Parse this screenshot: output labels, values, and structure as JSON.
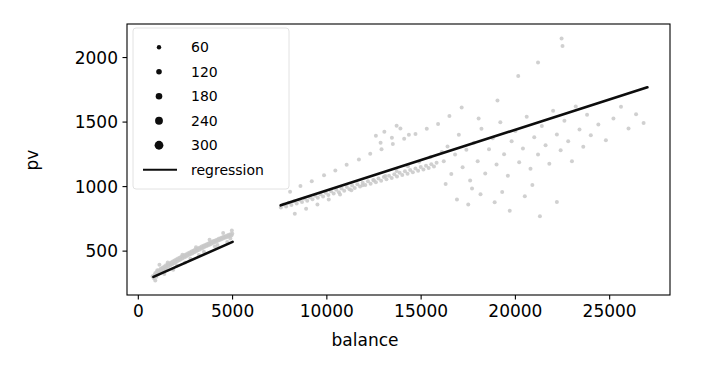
{
  "chart_data": {
    "type": "scatter",
    "title": "",
    "xlabel": "balance",
    "ylabel": "pv",
    "xlim": [
      -600,
      28200
    ],
    "ylim": [
      160,
      2260
    ],
    "xticks": [
      0,
      5000,
      10000,
      15000,
      20000,
      25000
    ],
    "xticklabels": [
      "0",
      "5000",
      "10000",
      "15000",
      "20000",
      "25000"
    ],
    "yticks": [
      500,
      1000,
      1500,
      2000
    ],
    "yticklabels": [
      "500",
      "1000",
      "1500",
      "2000"
    ],
    "grid": false,
    "marker_color": "#c8c8c8",
    "line_color": "#0d0d0d",
    "legend": {
      "position": "upper left",
      "size_title": "",
      "size_entries": [
        {
          "label": "60",
          "value": 60,
          "radius": 2.2
        },
        {
          "label": "120",
          "value": 120,
          "radius": 2.8
        },
        {
          "label": "180",
          "value": 180,
          "radius": 3.3
        },
        {
          "label": "240",
          "value": 240,
          "radius": 3.9
        },
        {
          "label": "300",
          "value": 300,
          "radius": 4.4
        }
      ],
      "line_entries": [
        {
          "label": "regression"
        }
      ]
    },
    "series": [
      {
        "name": "segment-low",
        "regression_line": {
          "x": [
            800,
            5000
          ],
          "y": [
            300,
            572
          ]
        },
        "points": [
          [
            760,
            306
          ],
          [
            812,
            292
          ],
          [
            880,
            318
          ],
          [
            905,
            330
          ],
          [
            960,
            301
          ],
          [
            1010,
            345
          ],
          [
            1060,
            322
          ],
          [
            1105,
            352
          ],
          [
            1150,
            338
          ],
          [
            1190,
            364
          ],
          [
            1240,
            349
          ],
          [
            1285,
            372
          ],
          [
            1330,
            358
          ],
          [
            1380,
            381
          ],
          [
            1420,
            366
          ],
          [
            1470,
            390
          ],
          [
            1510,
            374
          ],
          [
            1560,
            398
          ],
          [
            1600,
            383
          ],
          [
            1650,
            405
          ],
          [
            1695,
            391
          ],
          [
            1740,
            412
          ],
          [
            1790,
            399
          ],
          [
            1830,
            420
          ],
          [
            1880,
            407
          ],
          [
            1925,
            428
          ],
          [
            1970,
            414
          ],
          [
            2015,
            435
          ],
          [
            2060,
            422
          ],
          [
            2105,
            442
          ],
          [
            2150,
            429
          ],
          [
            2195,
            449
          ],
          [
            2240,
            436
          ],
          [
            2285,
            456
          ],
          [
            2330,
            443
          ],
          [
            2375,
            462
          ],
          [
            2420,
            450
          ],
          [
            2465,
            470
          ],
          [
            2510,
            457
          ],
          [
            2555,
            476
          ],
          [
            2600,
            464
          ],
          [
            2645,
            483
          ],
          [
            2690,
            471
          ],
          [
            2735,
            490
          ],
          [
            2780,
            478
          ],
          [
            2825,
            497
          ],
          [
            2870,
            484
          ],
          [
            2915,
            503
          ],
          [
            2960,
            491
          ],
          [
            3005,
            510
          ],
          [
            3050,
            498
          ],
          [
            3095,
            516
          ],
          [
            3140,
            505
          ],
          [
            3185,
            523
          ],
          [
            3230,
            511
          ],
          [
            3275,
            529
          ],
          [
            3320,
            518
          ],
          [
            3365,
            536
          ],
          [
            3410,
            524
          ],
          [
            3455,
            542
          ],
          [
            3500,
            531
          ],
          [
            3545,
            548
          ],
          [
            3590,
            537
          ],
          [
            3635,
            554
          ],
          [
            3680,
            544
          ],
          [
            3725,
            560
          ],
          [
            3770,
            550
          ],
          [
            3815,
            566
          ],
          [
            3860,
            556
          ],
          [
            3905,
            572
          ],
          [
            3950,
            562
          ],
          [
            3995,
            578
          ],
          [
            4040,
            568
          ],
          [
            4085,
            583
          ],
          [
            4130,
            574
          ],
          [
            4175,
            589
          ],
          [
            4220,
            580
          ],
          [
            4265,
            595
          ],
          [
            4310,
            586
          ],
          [
            4355,
            600
          ],
          [
            4400,
            592
          ],
          [
            4445,
            606
          ],
          [
            4490,
            597
          ],
          [
            4535,
            611
          ],
          [
            4580,
            603
          ],
          [
            4625,
            616
          ],
          [
            4670,
            608
          ],
          [
            4715,
            621
          ],
          [
            4760,
            613
          ],
          [
            4805,
            626
          ],
          [
            4850,
            618
          ],
          [
            4895,
            630
          ],
          [
            4940,
            622
          ],
          [
            4985,
            634
          ],
          [
            1120,
            395
          ],
          [
            1850,
            355
          ],
          [
            2480,
            412
          ],
          [
            3210,
            470
          ],
          [
            4060,
            535
          ],
          [
            4720,
            570
          ],
          [
            900,
            272
          ],
          [
            1380,
            322
          ],
          [
            2050,
            388
          ],
          [
            2760,
            440
          ],
          [
            3480,
            495
          ],
          [
            4200,
            548
          ],
          [
            4880,
            598
          ],
          [
            1560,
            412
          ],
          [
            2340,
            472
          ],
          [
            3060,
            530
          ],
          [
            3780,
            588
          ],
          [
            4500,
            640
          ],
          [
            1010,
            352
          ],
          [
            4960,
            660
          ]
        ]
      },
      {
        "name": "segment-high",
        "regression_line": {
          "x": [
            7550,
            27000
          ],
          "y": [
            855,
            1770
          ]
        },
        "points": [
          [
            7560,
            838
          ],
          [
            7700,
            862
          ],
          [
            7840,
            845
          ],
          [
            7980,
            874
          ],
          [
            8120,
            858
          ],
          [
            8260,
            886
          ],
          [
            8400,
            869
          ],
          [
            8540,
            896
          ],
          [
            8680,
            880
          ],
          [
            8820,
            908
          ],
          [
            8960,
            891
          ],
          [
            9100,
            918
          ],
          [
            9240,
            902
          ],
          [
            9380,
            930
          ],
          [
            9520,
            913
          ],
          [
            9660,
            941
          ],
          [
            9800,
            924
          ],
          [
            9940,
            952
          ],
          [
            10080,
            935
          ],
          [
            10220,
            963
          ],
          [
            10360,
            946
          ],
          [
            10500,
            975
          ],
          [
            10640,
            957
          ],
          [
            10780,
            986
          ],
          [
            10920,
            968
          ],
          [
            11060,
            997
          ],
          [
            11200,
            979
          ],
          [
            11340,
            1008
          ],
          [
            11480,
            990
          ],
          [
            11620,
            1019
          ],
          [
            11760,
            1001
          ],
          [
            11900,
            1030
          ],
          [
            12040,
            1012
          ],
          [
            12180,
            1041
          ],
          [
            12320,
            1023
          ],
          [
            12460,
            1052
          ],
          [
            12600,
            1034
          ],
          [
            12740,
            1063
          ],
          [
            12880,
            1045
          ],
          [
            13020,
            1074
          ],
          [
            13160,
            1056
          ],
          [
            13300,
            1085
          ],
          [
            13440,
            1067
          ],
          [
            13580,
            1096
          ],
          [
            13720,
            1078
          ],
          [
            13860,
            1107
          ],
          [
            14000,
            1089
          ],
          [
            14140,
            1118
          ],
          [
            14280,
            1100
          ],
          [
            14420,
            1129
          ],
          [
            14560,
            1111
          ],
          [
            14700,
            1140
          ],
          [
            14840,
            1122
          ],
          [
            14980,
            1151
          ],
          [
            15120,
            1133
          ],
          [
            15260,
            1162
          ],
          [
            15400,
            1144
          ],
          [
            15540,
            1173
          ],
          [
            15680,
            1155
          ],
          [
            15820,
            1184
          ],
          [
            8050,
            960
          ],
          [
            8600,
            1005
          ],
          [
            9200,
            1042
          ],
          [
            9850,
            1088
          ],
          [
            10450,
            1125
          ],
          [
            11050,
            1170
          ],
          [
            11700,
            1210
          ],
          [
            12300,
            1255
          ],
          [
            12900,
            1290
          ],
          [
            13500,
            1330
          ],
          [
            14100,
            1370
          ],
          [
            14700,
            1408
          ],
          [
            15300,
            1448
          ],
          [
            15900,
            1485
          ],
          [
            8300,
            790
          ],
          [
            8900,
            828
          ],
          [
            9500,
            862
          ],
          [
            10100,
            900
          ],
          [
            10700,
            938
          ],
          [
            11300,
            972
          ],
          [
            11900,
            1010
          ],
          [
            12500,
            1048
          ],
          [
            13100,
            1082
          ],
          [
            13700,
            1120
          ],
          [
            14300,
            1158
          ],
          [
            14900,
            1192
          ],
          [
            15500,
            1230
          ],
          [
            16100,
            1268
          ],
          [
            12600,
            1395
          ],
          [
            13050,
            1425
          ],
          [
            13450,
            1378
          ],
          [
            13900,
            1450
          ],
          [
            14350,
            1402
          ],
          [
            12850,
            1340
          ],
          [
            13700,
            1472
          ],
          [
            16200,
            1196
          ],
          [
            16400,
            1310
          ],
          [
            16600,
            1098
          ],
          [
            16800,
            1248
          ],
          [
            17000,
            1402
          ],
          [
            17200,
            1150
          ],
          [
            17400,
            1285
          ],
          [
            17600,
            1048
          ],
          [
            17800,
            1340
          ],
          [
            18000,
            1196
          ],
          [
            18200,
            1448
          ],
          [
            18400,
            1102
          ],
          [
            18600,
            1290
          ],
          [
            18800,
            1375
          ],
          [
            19000,
            1172
          ],
          [
            19200,
            1498
          ],
          [
            19400,
            1250
          ],
          [
            19600,
            1084
          ],
          [
            19800,
            1352
          ],
          [
            20000,
            1430
          ],
          [
            20200,
            1188
          ],
          [
            20400,
            1296
          ],
          [
            20600,
            1542
          ],
          [
            20800,
            1138
          ],
          [
            21000,
            1382
          ],
          [
            21200,
            1248
          ],
          [
            21400,
            1470
          ],
          [
            21600,
            1320
          ],
          [
            21800,
            1178
          ],
          [
            22000,
            1588
          ],
          [
            22200,
            1404
          ],
          [
            22400,
            1282
          ],
          [
            22600,
            1510
          ],
          [
            22800,
            1352
          ],
          [
            23000,
            1196
          ],
          [
            23200,
            1620
          ],
          [
            23400,
            1442
          ],
          [
            23600,
            1308
          ],
          [
            23800,
            1556
          ],
          [
            24000,
            1398
          ],
          [
            24400,
            1482
          ],
          [
            24800,
            1360
          ],
          [
            25200,
            1528
          ],
          [
            25600,
            1618
          ],
          [
            26000,
            1450
          ],
          [
            26400,
            1560
          ],
          [
            26800,
            1492
          ],
          [
            22450,
            2148
          ],
          [
            22500,
            2090
          ],
          [
            21200,
            1962
          ],
          [
            20150,
            1858
          ],
          [
            16500,
            1548
          ],
          [
            17150,
            1612
          ],
          [
            18050,
            1528
          ],
          [
            19050,
            1668
          ],
          [
            16900,
            900
          ],
          [
            17500,
            862
          ],
          [
            18150,
            940
          ],
          [
            18900,
            878
          ],
          [
            19700,
            812
          ],
          [
            20500,
            925
          ],
          [
            21300,
            770
          ],
          [
            22200,
            880
          ],
          [
            16300,
            1020
          ],
          [
            17700,
            985
          ],
          [
            19300,
            958
          ],
          [
            20900,
            1012
          ]
        ]
      }
    ]
  },
  "axes": {
    "x_label": "balance",
    "y_label": "pv"
  }
}
